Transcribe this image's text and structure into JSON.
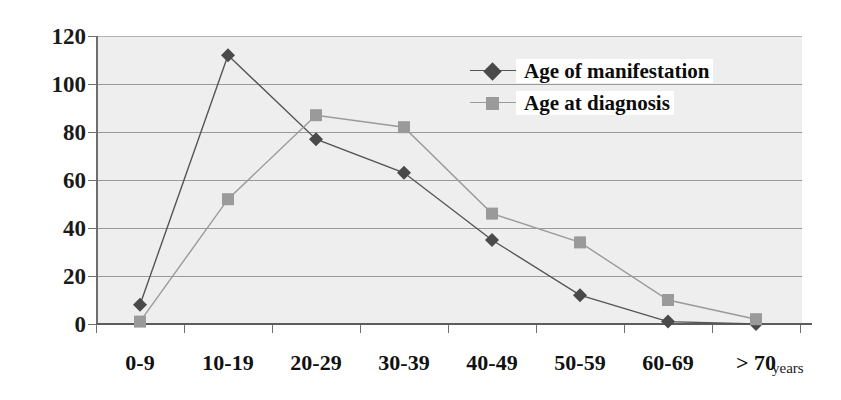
{
  "chart_data": {
    "type": "line",
    "title": "",
    "xlabel": "years",
    "ylabel": "",
    "categories": [
      "0-9",
      "10-19",
      "20-29",
      "30-39",
      "40-49",
      "50-59",
      "60-69",
      "> 70"
    ],
    "series": [
      {
        "name": "Age of manifestation",
        "marker": "diamond",
        "color": "#555555",
        "values": [
          8,
          112,
          77,
          63,
          35,
          12,
          1,
          0
        ]
      },
      {
        "name": "Age at diagnosis",
        "marker": "square",
        "color": "#9a9a9a",
        "values": [
          1,
          52,
          87,
          82,
          46,
          34,
          10,
          2
        ]
      }
    ],
    "ylim": [
      0,
      120
    ],
    "yticks": [
      0,
      20,
      40,
      60,
      80,
      100,
      120
    ],
    "ytick_labels": [
      "0",
      "20",
      "40",
      "60",
      "80",
      "100",
      "120"
    ],
    "grid": true,
    "legend_position": "upper-right-inside",
    "plot_background": "#eeeeee",
    "page_background": "#ffffff",
    "gridline_color": "#9a9a9a",
    "axis_color": "#5c5c5c"
  },
  "axis": {
    "x_unit": "years"
  },
  "legend": {
    "items": [
      {
        "label": "Age of manifestation"
      },
      {
        "label": "Age at diagnosis"
      }
    ]
  }
}
